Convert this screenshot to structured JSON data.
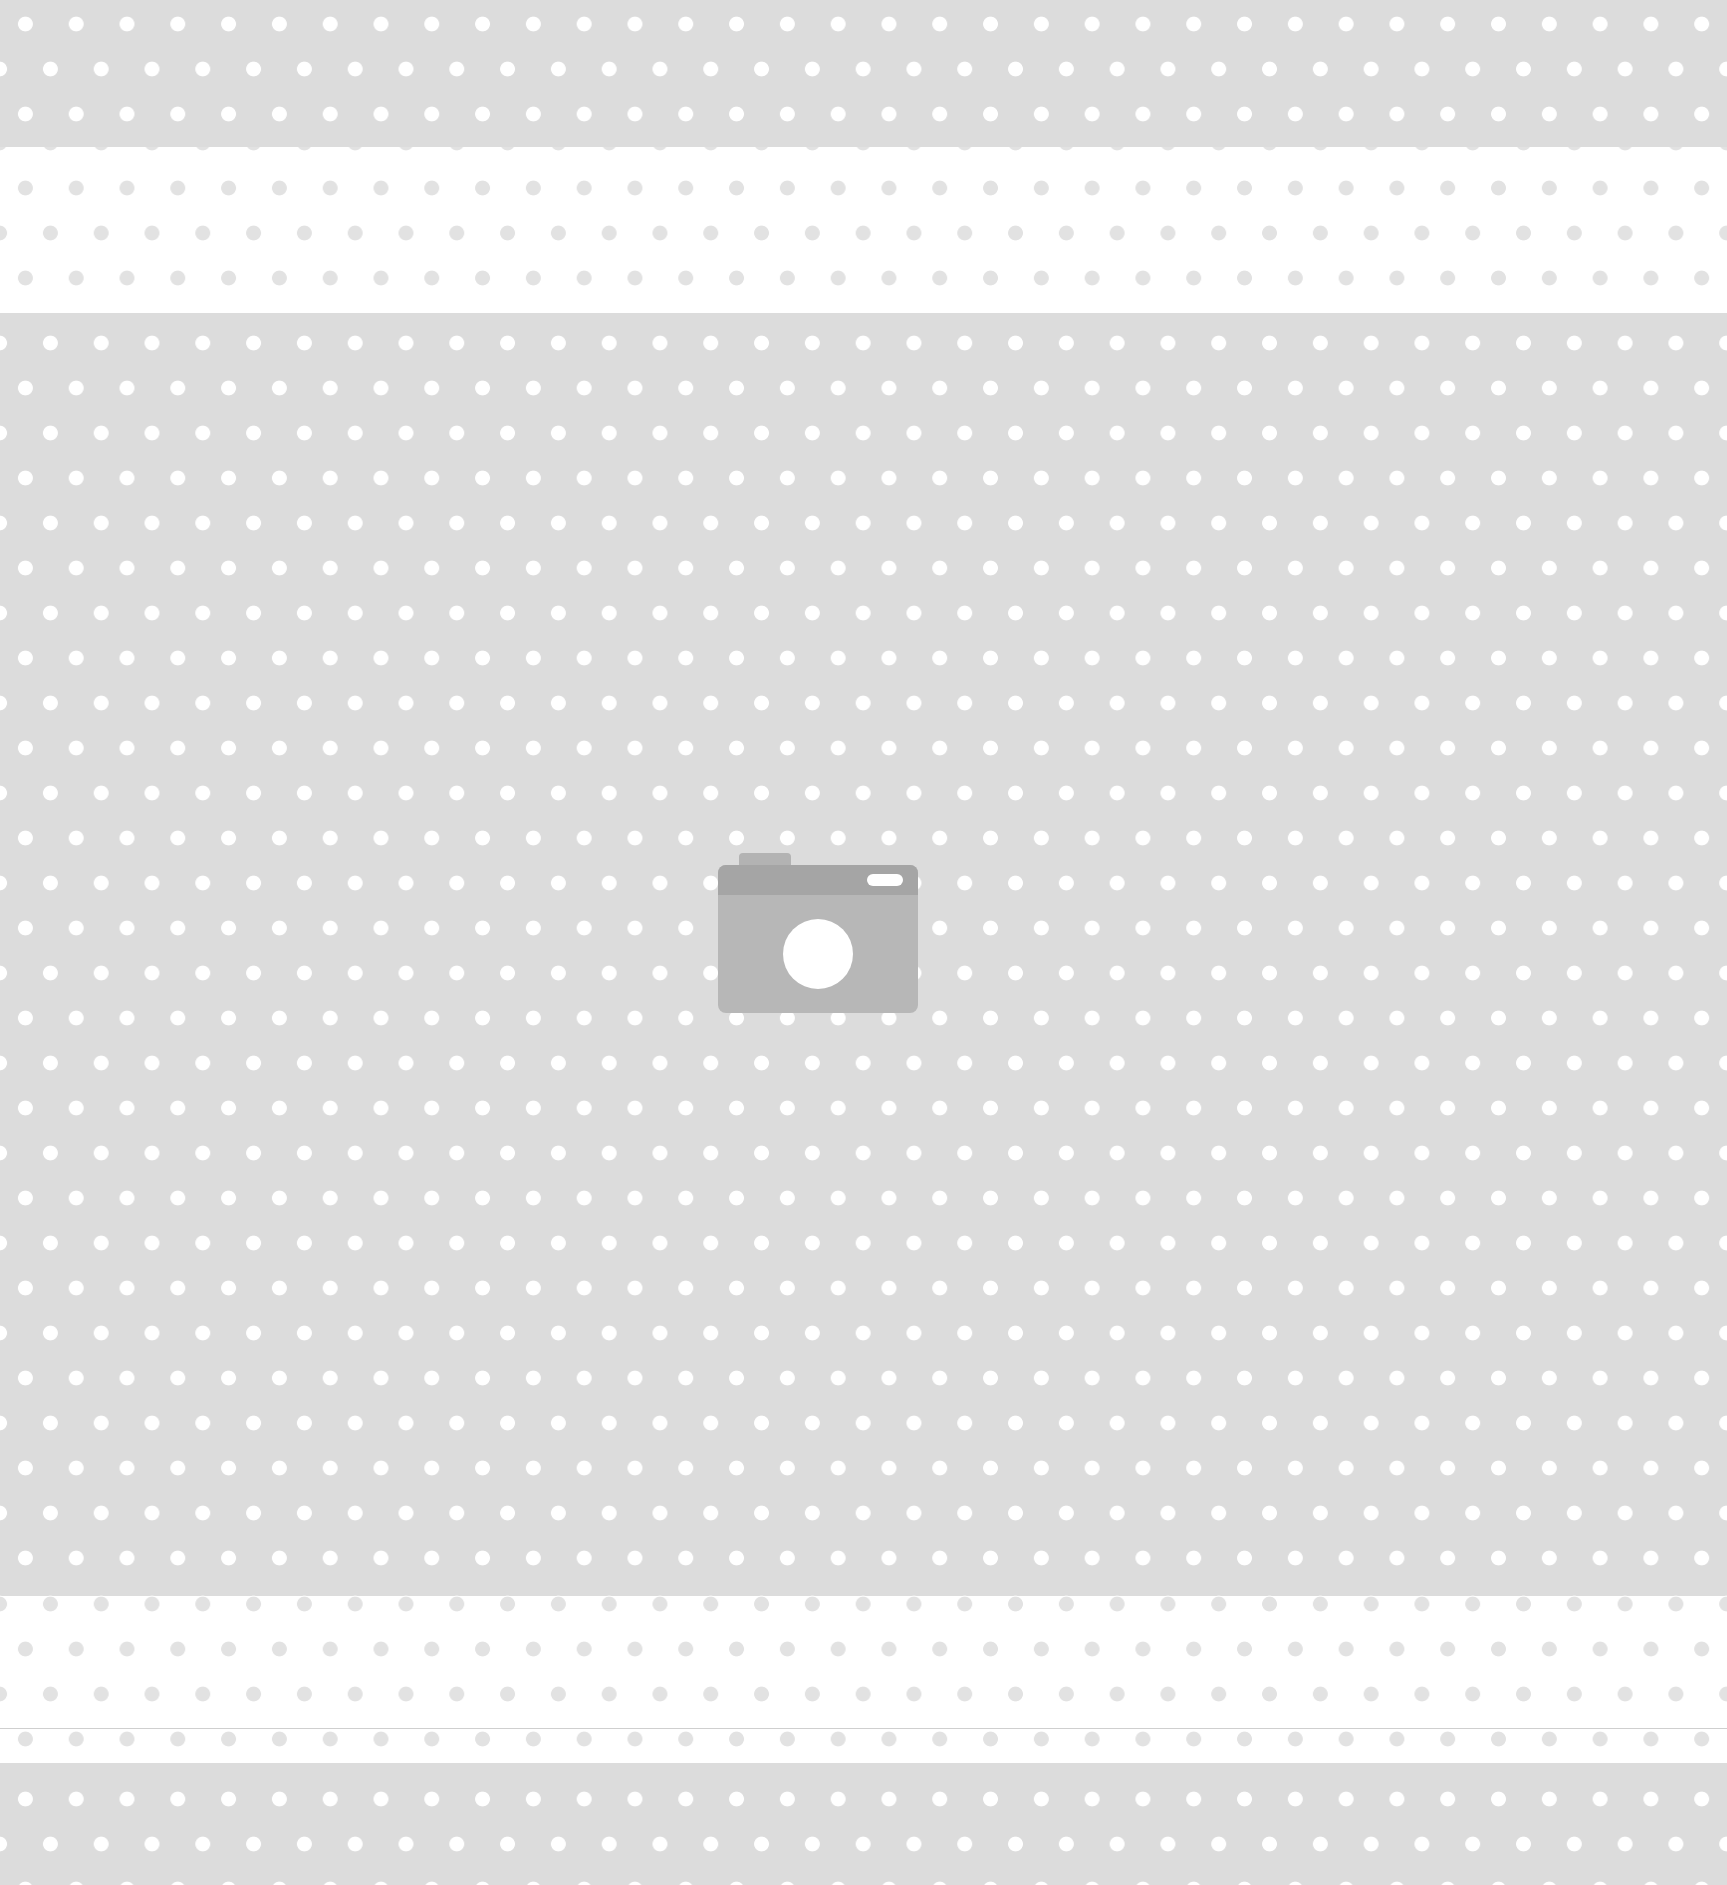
{
  "image": {
    "kind": "placeholder",
    "icon": "camera-icon",
    "colors": {
      "gray_band": "#dcdcdc",
      "white_band": "#ffffff",
      "dot_on_gray": "#ffffff",
      "dot_on_white": "#e2e2e2",
      "camera_body": "#b7b7b7",
      "camera_top": "#a5a5a5"
    },
    "bands": [
      {
        "type": "gray",
        "top": 0,
        "height": 147
      },
      {
        "type": "white",
        "top": 147,
        "height": 166
      },
      {
        "type": "gray",
        "top": 313,
        "height": 1283
      },
      {
        "type": "white",
        "top": 1596,
        "height": 167
      },
      {
        "type": "gray",
        "top": 1763,
        "height": 122
      }
    ]
  }
}
